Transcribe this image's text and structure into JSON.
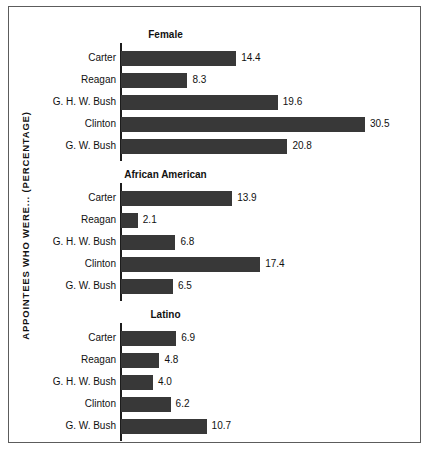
{
  "axis_title": "APPOINTEES WHO WERE... (PERCENTAGE)",
  "colors": {
    "bar": "#383838",
    "axis": "#1d1d1d",
    "border": "#5c5c5c",
    "text": "#111111",
    "background": "#ffffff"
  },
  "chart_data": {
    "type": "bar",
    "title": "",
    "xlabel": "",
    "ylabel": "APPOINTEES WHO WERE... (PERCENTAGE)",
    "orientation": "horizontal",
    "grid": false,
    "legend": "none",
    "xlim": [
      0,
      32
    ],
    "categories": [
      "Carter",
      "Reagan",
      "G. H. W. Bush",
      "Clinton",
      "G. W. Bush"
    ],
    "panels": [
      {
        "title": "Female",
        "categories": [
          "Carter",
          "Reagan",
          "G. H. W. Bush",
          "Clinton",
          "G. W. Bush"
        ],
        "values": [
          14.4,
          8.3,
          19.6,
          30.5,
          20.8
        ],
        "labels": [
          "14.4",
          "8.3",
          "19.6",
          "30.5",
          "20.8"
        ]
      },
      {
        "title": "African American",
        "categories": [
          "Carter",
          "Reagan",
          "G. H. W. Bush",
          "Clinton",
          "G. W. Bush"
        ],
        "values": [
          13.9,
          2.1,
          6.8,
          17.4,
          6.5
        ],
        "labels": [
          "13.9",
          "2.1",
          "6.8",
          "17.4",
          "6.5"
        ]
      },
      {
        "title": "Latino",
        "categories": [
          "Carter",
          "Reagan",
          "G. H. W. Bush",
          "Clinton",
          "G. W. Bush"
        ],
        "values": [
          6.9,
          4.8,
          4.0,
          6.2,
          10.7
        ],
        "labels": [
          "6.9",
          "4.8",
          "4.0",
          "6.2",
          "10.7"
        ]
      }
    ]
  }
}
